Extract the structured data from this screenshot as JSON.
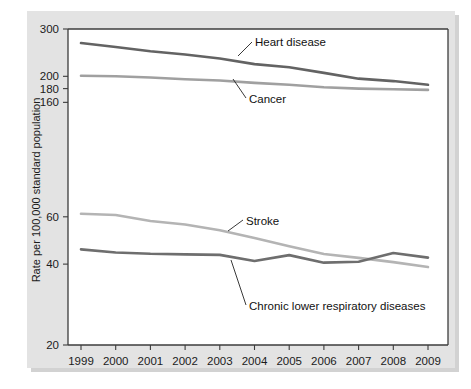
{
  "figure": {
    "background_color": "#e3e3e3",
    "plot_background_color": "#ffffff"
  },
  "chart_data": {
    "type": "line",
    "title": "",
    "subtitle": "",
    "xlabel": "",
    "ylabel": "Rate per 100,000 standard population",
    "x": [
      1999,
      2000,
      2001,
      2002,
      2003,
      2004,
      2005,
      2006,
      2007,
      2008,
      2009
    ],
    "categories": [
      "1999",
      "2000",
      "2001",
      "2002",
      "2003",
      "2004",
      "2005",
      "2006",
      "2007",
      "2008",
      "2009"
    ],
    "yscale": "log",
    "ylim": [
      20,
      300
    ],
    "yticks": [
      300,
      200,
      180,
      160,
      60,
      40,
      20
    ],
    "ytick_labels": [
      "300",
      "200",
      "180",
      "160",
      "60",
      "40",
      "20"
    ],
    "grid": false,
    "legend": "inline-annotations",
    "series": [
      {
        "name": "Heart disease",
        "color": "#636363",
        "label_x": 2003.0,
        "values": [
          266,
          257,
          248,
          241,
          233,
          222,
          216,
          206,
          196,
          192,
          186
        ]
      },
      {
        "name": "Cancer",
        "color": "#a0a0a0",
        "label_x": 2003.0,
        "values": [
          201,
          200,
          198,
          195,
          193,
          189,
          186,
          182,
          180,
          179,
          178
        ]
      },
      {
        "name": "Stroke",
        "color": "#b4b4b4",
        "label_x": 2005.6,
        "values": [
          61.6,
          60.9,
          57.9,
          56.2,
          53.5,
          50.0,
          46.6,
          43.6,
          42.2,
          40.7,
          39.0
        ]
      },
      {
        "name": "Chronic lower respiratory diseases",
        "color": "#6e6e6e",
        "label_x": 2004.6,
        "values": [
          45.4,
          44.2,
          43.7,
          43.5,
          43.3,
          41.1,
          43.2,
          40.5,
          40.8,
          44.0,
          42.3
        ]
      }
    ]
  },
  "annotations": {
    "heart_disease_label": "Heart disease",
    "cancer_label": "Cancer",
    "stroke_label": "Stroke",
    "clrd_label": "Chronic lower respiratory diseases"
  }
}
